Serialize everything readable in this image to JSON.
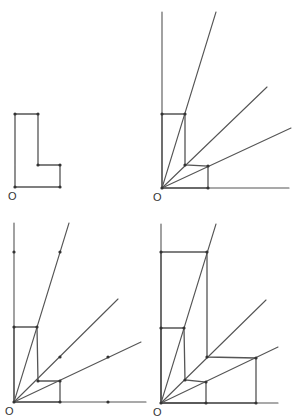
{
  "diagram": {
    "origin_label": "O",
    "colors": {
      "line": "#555555",
      "point": "#333333",
      "background": "#ffffff"
    },
    "panels": [
      {
        "id": "panel-1",
        "origin": [
          15,
          187
        ],
        "label_pos": [
          10,
          199
        ],
        "axes": [],
        "rays": [],
        "shapes": [
          {
            "name": "original-l-shape",
            "points": [
              [
                15,
                187
              ],
              [
                15,
                114
              ],
              [
                38,
                114
              ],
              [
                38,
                165
              ],
              [
                60,
                165
              ],
              [
                60,
                187
              ]
            ]
          }
        ],
        "points": [
          [
            15,
            187
          ],
          [
            15,
            114
          ],
          [
            38,
            114
          ],
          [
            38,
            165
          ],
          [
            60,
            165
          ],
          [
            60,
            187
          ]
        ]
      },
      {
        "id": "panel-2",
        "origin": [
          162,
          188
        ],
        "label_pos": [
          155,
          200
        ],
        "axes": [
          {
            "name": "vertical-axis",
            "from": [
              162,
              188
            ],
            "to": [
              162,
              12
            ]
          },
          {
            "name": "horizontal-axis",
            "from": [
              162,
              188
            ],
            "to": [
              289,
              188
            ]
          }
        ],
        "rays": [
          {
            "name": "ray-steep",
            "from": [
              162,
              188
            ],
            "to": [
              216,
              12
            ]
          },
          {
            "name": "ray-middle",
            "from": [
              162,
              188
            ],
            "to": [
              267,
              87
            ]
          },
          {
            "name": "ray-shallow",
            "from": [
              162,
              188
            ],
            "to": [
              291,
              128
            ]
          }
        ],
        "shapes": [
          {
            "name": "original-l-shape",
            "points": [
              [
                162,
                188
              ],
              [
                162,
                114
              ],
              [
                185,
                114
              ],
              [
                185,
                165
              ],
              [
                208,
                166
              ],
              [
                208,
                188
              ]
            ]
          }
        ],
        "points": [
          [
            162,
            188
          ],
          [
            162,
            114
          ],
          [
            185,
            114
          ],
          [
            185,
            165
          ],
          [
            208,
            166
          ],
          [
            208,
            188
          ]
        ]
      },
      {
        "id": "panel-3",
        "origin": [
          14,
          402
        ],
        "label_pos": [
          7,
          414
        ],
        "axes": [
          {
            "name": "vertical-axis",
            "from": [
              14,
              402
            ],
            "to": [
              14,
              223
            ]
          },
          {
            "name": "horizontal-axis",
            "from": [
              14,
              402
            ],
            "to": [
              146,
              402
            ]
          }
        ],
        "rays": [
          {
            "name": "ray-steep",
            "from": [
              14,
              402
            ],
            "to": [
              69,
              223
            ]
          },
          {
            "name": "ray-middle",
            "from": [
              14,
              402
            ],
            "to": [
              118,
              299
            ]
          },
          {
            "name": "ray-shallow",
            "from": [
              14,
              402
            ],
            "to": [
              141,
              342
            ]
          }
        ],
        "shapes": [
          {
            "name": "original-l-shape",
            "points": [
              [
                14,
                402
              ],
              [
                14,
                327
              ],
              [
                37,
                327
              ],
              [
                38,
                381
              ],
              [
                60,
                381
              ],
              [
                60,
                402
              ]
            ]
          }
        ],
        "points": [
          [
            14,
            402
          ],
          [
            14,
            327
          ],
          [
            37,
            327
          ],
          [
            38,
            381
          ],
          [
            60,
            381
          ],
          [
            60,
            402
          ],
          [
            14,
            252
          ],
          [
            60,
            252
          ],
          [
            60,
            357
          ],
          [
            108,
            357
          ],
          [
            108,
            402
          ]
        ]
      },
      {
        "id": "panel-4",
        "origin": [
          161,
          403
        ],
        "label_pos": [
          155,
          415
        ],
        "axes": [
          {
            "name": "vertical-axis",
            "from": [
              161,
              403
            ],
            "to": [
              161,
              224
            ]
          },
          {
            "name": "horizontal-axis",
            "from": [
              161,
              403
            ],
            "to": [
              278,
              403
            ]
          }
        ],
        "rays": [
          {
            "name": "ray-steep",
            "from": [
              161,
              403
            ],
            "to": [
              216,
              224
            ]
          },
          {
            "name": "ray-middle",
            "from": [
              161,
              403
            ],
            "to": [
              266,
              300
            ]
          },
          {
            "name": "ray-shallow",
            "from": [
              161,
              403
            ],
            "to": [
              278,
              347
            ]
          }
        ],
        "shapes": [
          {
            "name": "original-l-shape",
            "points": [
              [
                161,
                403
              ],
              [
                161,
                328
              ],
              [
                184,
                328
              ],
              [
                185,
                380
              ],
              [
                206,
                382
              ],
              [
                206,
                403
              ]
            ]
          },
          {
            "name": "dilated-l-shape",
            "points": [
              [
                161,
                403
              ],
              [
                161,
                252
              ],
              [
                207,
                252
              ],
              [
                207,
                357
              ],
              [
                256,
                358
              ],
              [
                256,
                403
              ]
            ]
          }
        ],
        "points": [
          [
            161,
            403
          ],
          [
            161,
            328
          ],
          [
            184,
            328
          ],
          [
            185,
            380
          ],
          [
            206,
            382
          ],
          [
            206,
            403
          ],
          [
            161,
            252
          ],
          [
            207,
            252
          ],
          [
            207,
            357
          ],
          [
            256,
            358
          ],
          [
            256,
            403
          ]
        ]
      }
    ]
  }
}
